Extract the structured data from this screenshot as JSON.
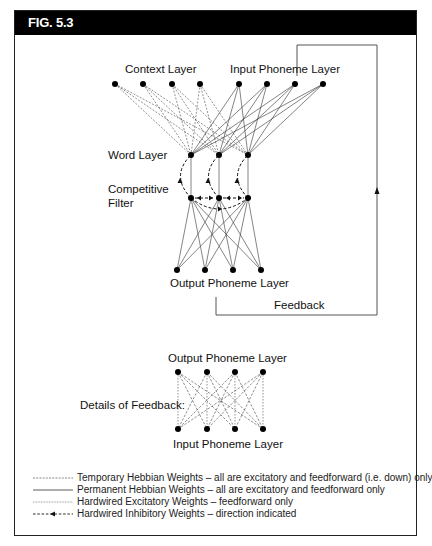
{
  "figure": {
    "title": "FIG. 5.3"
  },
  "labels": {
    "context_layer": "Context Layer",
    "input_phoneme_layer": "Input Phoneme Layer",
    "word_layer": "Word Layer",
    "competitive_filter_line1": "Competitive",
    "competitive_filter_line2": "Filter",
    "output_phoneme_layer": "Output Phoneme Layer",
    "feedback": "Feedback",
    "details_of_feedback": "Details of Feedback:",
    "details_output_phoneme_layer": "Output Phoneme Layer",
    "details_input_phoneme_layer": "Input Phoneme Layer"
  },
  "legend": {
    "items": [
      {
        "style": "dashed-fine",
        "label": "Temporary Hebbian Weights – all are excitatory and feedforward (i.e. down) only"
      },
      {
        "style": "solid",
        "label": "Permanent Hebbian Weights – all are excitatory and feedforward only"
      },
      {
        "style": "dotted",
        "label": "Hardwired Excitatory Weights – feedforward only"
      },
      {
        "style": "dashed-arrow",
        "label": "Hardwired Inhibitory Weights – direction indicated"
      }
    ]
  },
  "layers": {
    "context_nodes": 4,
    "input_phoneme_nodes": 4,
    "word_nodes": 3,
    "filter_nodes": 3,
    "output_phoneme_nodes": 4,
    "details_output_nodes": 4,
    "details_input_nodes": 4
  }
}
